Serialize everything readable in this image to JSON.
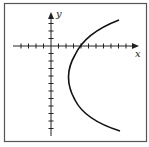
{
  "figure": {
    "type": "graph-of-parabola",
    "x_axis_label": "x",
    "y_axis_label": "y",
    "tick_spacing_px": 7.5,
    "curve": {
      "description": "parabola opening to the right",
      "vertex_units": [
        2,
        -4
      ],
      "x_intercept_units": 4
    },
    "colors": {
      "frame": "#555555",
      "axes": "#222222",
      "curve": "#111111",
      "background": "#ffffff"
    }
  }
}
